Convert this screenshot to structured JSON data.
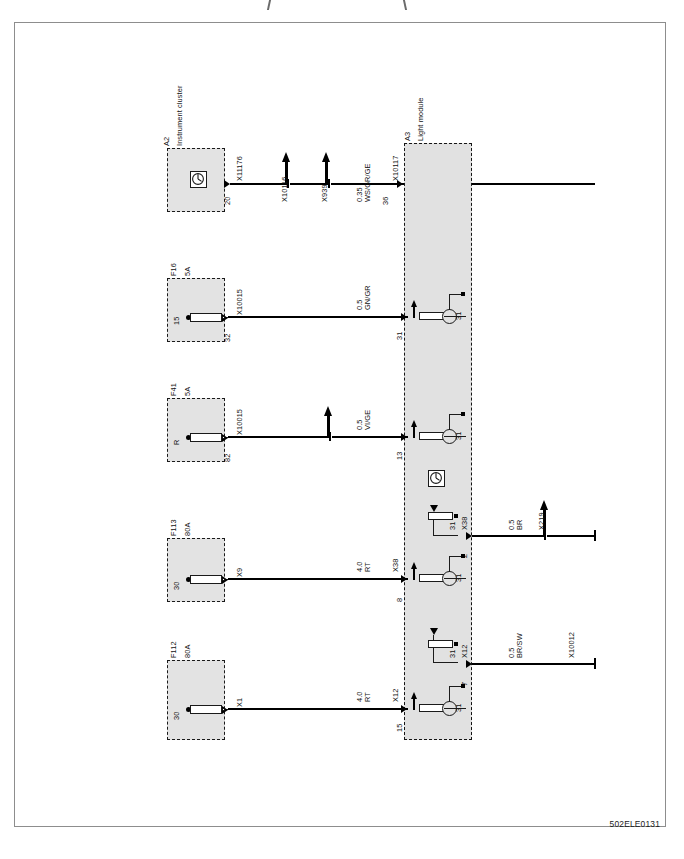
{
  "document": {
    "figure_code": "502ELE0131",
    "diagram_type": "automotive wiring diagram"
  },
  "components": [
    {
      "id": "A2",
      "name": "Instrument cluster",
      "symbol": "gauge-icon",
      "terminal": "",
      "pin": "20",
      "connector": "X11176"
    },
    {
      "id": "F16",
      "name": "",
      "rating": "5A",
      "symbol": "fuse-icon",
      "terminal": "15",
      "pin": "32",
      "connector": "X10015"
    },
    {
      "id": "F41",
      "name": "",
      "rating": "5A",
      "symbol": "fuse-icon",
      "terminal": "R",
      "pin": "82",
      "connector": "X10015"
    },
    {
      "id": "F113",
      "name": "",
      "rating": "80A",
      "symbol": "fuse-icon",
      "terminal": "30",
      "pin": "",
      "connector": "X9"
    },
    {
      "id": "F112",
      "name": "",
      "rating": "80A",
      "symbol": "fuse-icon",
      "terminal": "30",
      "pin": "",
      "connector": "X1"
    },
    {
      "id": "A3",
      "name": "Light module",
      "symbol": "module-box"
    }
  ],
  "wires": [
    {
      "id": "w1",
      "from_pin": "20",
      "from_connector": "X11176",
      "branches": [
        "X10116",
        "X939"
      ],
      "gauge": "0.35",
      "color_code": "WS/GR/GE",
      "to_connector": "X10117",
      "to_pin": "36"
    },
    {
      "id": "w2",
      "from_pin": "32",
      "from_connector": "X10015",
      "branches": [],
      "gauge": "0.5",
      "color_code": "GN/GR",
      "to_connector": "",
      "to_pin": "31"
    },
    {
      "id": "w3",
      "from_pin": "82",
      "from_connector": "X10015",
      "branches": [
        ""
      ],
      "gauge": "0.5",
      "color_code": "VI/GE",
      "to_connector": "",
      "to_pin": "13"
    },
    {
      "id": "w4",
      "from_pin": "",
      "from_connector": "X9",
      "branches": [],
      "gauge": "4.0",
      "color_code": "RT",
      "to_connector": "X38",
      "to_pin": "8"
    },
    {
      "id": "w5",
      "from_pin": "",
      "from_connector": "X1",
      "branches": [],
      "gauge": "4.0",
      "color_code": "RT",
      "to_connector": "X12",
      "to_pin": "15"
    },
    {
      "id": "w6",
      "from_pin": "2",
      "from_connector": "X38",
      "branches": [
        "X219"
      ],
      "gauge": "0.5",
      "color_code": "BR",
      "to_connector": "",
      "to_pin": ""
    },
    {
      "id": "w7",
      "from_pin": "7",
      "from_connector": "X12",
      "branches": [],
      "gauge": "0.5",
      "color_code": "BR/SW",
      "to_connector": "X10012",
      "to_pin": ""
    }
  ],
  "ground_labels": [
    "31",
    "31",
    "31",
    "31",
    "31"
  ],
  "internal_symbols": {
    "gauge_count": 2,
    "transistor_count": 4
  }
}
